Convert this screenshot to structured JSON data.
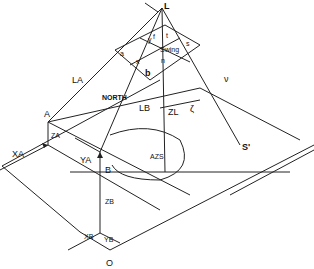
{
  "diagram": {
    "type": "photogrammetry-geometry-sketch",
    "stroke_color": "#222222",
    "points": {
      "L": "L",
      "A": "A",
      "B": "B",
      "O": "O",
      "S_prime": "S'",
      "a": "a",
      "b": "b",
      "s": "s",
      "n": "n",
      "f": "f"
    },
    "labels": {
      "LA": "LA",
      "LB": "LB",
      "ZA": "ZA",
      "ZB": "ZB",
      "ZL": "ZL",
      "XA": "XA",
      "YA": "YA",
      "XB": "XB",
      "YB": "YB",
      "x": "x",
      "y": "y",
      "north": "NORTH",
      "azs": "AZS",
      "swing": "Swing",
      "t": "t",
      "zeta": "ζ",
      "nu": "ν"
    }
  }
}
